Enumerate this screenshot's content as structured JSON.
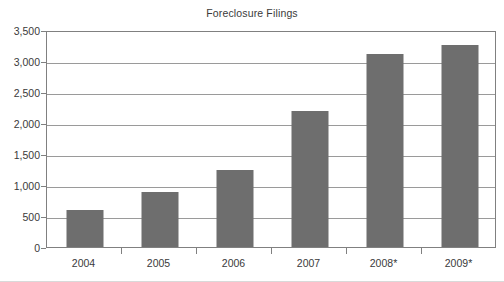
{
  "chart_data": {
    "type": "bar",
    "title": "Foreclosure Filings",
    "xlabel": "",
    "ylabel": "",
    "categories": [
      "2004",
      "2005",
      "2006",
      "2007",
      "2008*",
      "2009*"
    ],
    "values": [
      600,
      890,
      1250,
      2190,
      3120,
      3260
    ],
    "series": [
      {
        "name": "Foreclosure Filings",
        "values": [
          600,
          890,
          1250,
          2190,
          3120,
          3260
        ]
      }
    ],
    "ylim": [
      0,
      3500
    ],
    "ytick_labels": [
      "0",
      "500",
      "1,000",
      "1,500",
      "2,000",
      "2,500",
      "3,000",
      "3,500"
    ],
    "ytick_values": [
      0,
      500,
      1000,
      1500,
      2000,
      2500,
      3000,
      3500
    ],
    "grid": true,
    "legend": "none",
    "bar_color": "#6e6e6e",
    "gridline_color": "#9a9a9a",
    "axis_color": "#808080",
    "text_color": "#3a3a3a",
    "background_color": "#ffffff"
  }
}
